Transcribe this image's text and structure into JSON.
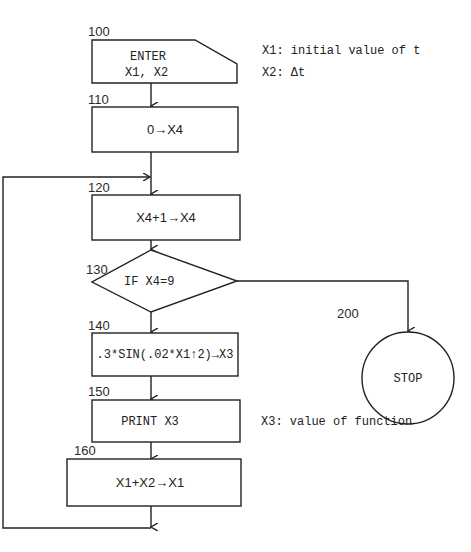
{
  "flowchart": {
    "nodes": [
      {
        "id": "100",
        "type": "input",
        "label_number": "100",
        "lines": [
          "ENTER",
          "X1, X2"
        ]
      },
      {
        "id": "110",
        "type": "process",
        "label_number": "110",
        "text": "0→X4"
      },
      {
        "id": "120",
        "type": "process",
        "label_number": "120",
        "text": "X4+1→X4"
      },
      {
        "id": "130",
        "type": "decision",
        "label_number": "130",
        "text": "IF X4=9"
      },
      {
        "id": "140",
        "type": "process",
        "label_number": "140",
        "text": ".3*SIN(.02*X1↑2)→X3"
      },
      {
        "id": "150",
        "type": "output",
        "label_number": "150",
        "text": "PRINT X3"
      },
      {
        "id": "160",
        "type": "process",
        "label_number": "160",
        "text": "X1+X2→X1"
      },
      {
        "id": "200",
        "type": "terminal",
        "label_number": "200",
        "text": "STOP"
      }
    ],
    "annotations": [
      {
        "text": "X1: initial value of t"
      },
      {
        "text": "X2: Δt"
      },
      {
        "text": "X3: value of function"
      }
    ],
    "edges": [
      {
        "from": "100",
        "to": "110"
      },
      {
        "from": "110",
        "to": "120"
      },
      {
        "from": "120",
        "to": "130"
      },
      {
        "from": "130",
        "to": "140",
        "condition": "false"
      },
      {
        "from": "130",
        "to": "200",
        "condition": "true"
      },
      {
        "from": "140",
        "to": "150"
      },
      {
        "from": "150",
        "to": "160"
      },
      {
        "from": "160",
        "to": "120",
        "type": "loop"
      }
    ]
  }
}
